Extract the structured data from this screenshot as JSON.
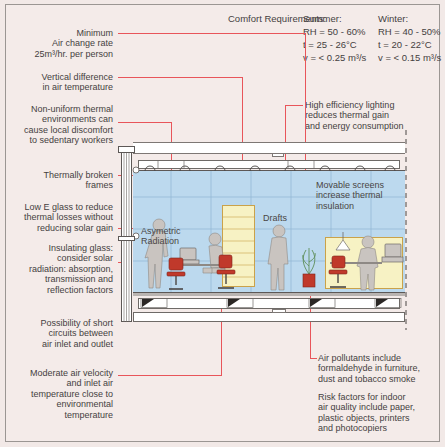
{
  "comfort": {
    "heading": "Comfort Requirements:",
    "columns": [
      {
        "season": "Summer:",
        "rh": "RH = 50 - 60%",
        "t": "t = 25 - 26°C",
        "v": "v = < 0.25 m³/s"
      },
      {
        "season": "Winter:",
        "rh": "RH = 40 - 50%",
        "t": "t = 20 - 22°C",
        "v": "v = < 0.15 m³/s"
      }
    ]
  },
  "left_annotations": [
    {
      "id": "air-change-rate",
      "text": "Minimum\nAir change rate\n25m³/hr. per person"
    },
    {
      "id": "vertical-difference",
      "text": "Vertical difference\nin air temperature"
    },
    {
      "id": "non-uniform-thermal",
      "text": "Non-uniform thermal\nenvironments can\ncause local discomfort\nto sedentary workers"
    },
    {
      "id": "thermally-broken-frames",
      "text": "Thermally broken\nframes"
    },
    {
      "id": "low-e-glass",
      "text": "Low E glass to reduce\nthermal losses without\nreducing solar gain"
    },
    {
      "id": "insulating-glass",
      "text": "Insulating glass:\nconsider solar\nradiation: absorption,\ntransmission and\nreflection factors"
    },
    {
      "id": "short-circuits",
      "text": "Possibility of short\ncircuits between\nair inlet and outlet"
    },
    {
      "id": "moderate-air-velocity",
      "text": "Moderate air velocity\nand inlet air\ntemperature close to\nenvironmental\ntemperature"
    }
  ],
  "right_annotations": [
    {
      "id": "high-efficiency-lighting",
      "text": "High efficiency lighting\nreduces thermal gain\nand energy consumption"
    },
    {
      "id": "air-pollutants",
      "text": "Air pollutants include\nformaldehyde in furniture,\ndust and tobacco smoke"
    },
    {
      "id": "risk-factors",
      "text": "Risk factors for indoor\nair quality include paper,\nplastic objects, printers\nand photocopiers"
    }
  ],
  "scene_labels": [
    {
      "id": "asymmetric-radiation",
      "text": "Asymetric\nRadiation"
    },
    {
      "id": "drafts",
      "text": "Drafts"
    },
    {
      "id": "movable-screens",
      "text": "Movable screens\nincrease thermal\ninsulation"
    }
  ],
  "colors": {
    "background": "#f4ebe9",
    "leader": "#e8555a",
    "sky": "#bcd9ee",
    "screen": "#f7f2c4",
    "figure": "#c9c4c0",
    "chair": "#c0392b",
    "text": "#45413f"
  }
}
